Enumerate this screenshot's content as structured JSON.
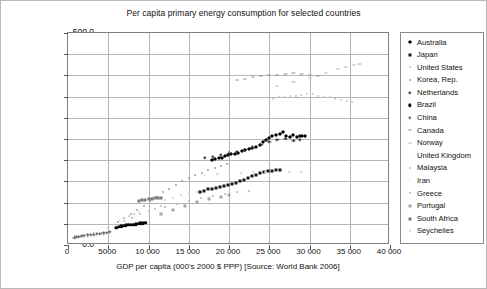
{
  "chart_data": {
    "type": "scatter",
    "title": "Per capita primary energy consumption for selected countries",
    "xlabel": "GDP per capita (000's 2000 $ PPP) [Source: World Bank 2006]",
    "ylabel_line1": "Primary energy consumption/(GJ·capita⁻¹) [Source: EIA",
    "ylabel_line2": "International Energy Annual 2004]",
    "xlim": [
      0,
      40000
    ],
    "ylim": [
      0,
      500
    ],
    "xticks": [
      "0",
      "5000",
      "10 000",
      "15 000",
      "20 000",
      "25 000",
      "30 000",
      "35 000",
      "40 000"
    ],
    "xtick_values": [
      0,
      5000,
      10000,
      15000,
      20000,
      25000,
      30000,
      35000,
      40000
    ],
    "yticks": [
      "0.0",
      "50.0",
      "100.0",
      "150.0",
      "200.0",
      "250.0",
      "300.0",
      "350.0",
      "400.0",
      "450.0",
      "500.0"
    ],
    "ytick_values": [
      0,
      50,
      100,
      150,
      200,
      250,
      300,
      350,
      400,
      450,
      500
    ],
    "grid": true,
    "legend_position": "right-outside",
    "series": [
      {
        "name": "Australia",
        "marker": "diamond",
        "color": "#000000",
        "points": [
          [
            17900,
            200
          ],
          [
            18300,
            203
          ],
          [
            18700,
            206
          ],
          [
            19100,
            205
          ],
          [
            19500,
            209
          ],
          [
            19900,
            212
          ],
          [
            20300,
            215
          ],
          [
            20700,
            214
          ],
          [
            21100,
            218
          ],
          [
            21600,
            221
          ],
          [
            22000,
            223
          ],
          [
            22500,
            226
          ],
          [
            22900,
            229
          ],
          [
            23300,
            231
          ],
          [
            23800,
            236
          ],
          [
            24200,
            243
          ],
          [
            24600,
            248
          ],
          [
            25000,
            252
          ],
          [
            25400,
            256
          ],
          [
            25900,
            259
          ],
          [
            26300,
            262
          ],
          [
            26700,
            266
          ],
          [
            27100,
            258
          ],
          [
            27600,
            255
          ],
          [
            28000,
            259
          ],
          [
            28400,
            254
          ],
          [
            28800,
            257
          ],
          [
            29100,
            256
          ],
          [
            29400,
            258
          ]
        ]
      },
      {
        "name": "Japan",
        "marker": "square",
        "color": "#181818",
        "points": [
          [
            16400,
            125
          ],
          [
            16900,
            128
          ],
          [
            17400,
            131
          ],
          [
            17900,
            133
          ],
          [
            18400,
            134
          ],
          [
            18900,
            137
          ],
          [
            19400,
            139
          ],
          [
            19900,
            141
          ],
          [
            20400,
            143
          ],
          [
            20900,
            146
          ],
          [
            21400,
            150
          ],
          [
            21900,
            154
          ],
          [
            22400,
            158
          ],
          [
            22900,
            162
          ],
          [
            23400,
            166
          ],
          [
            23900,
            170
          ],
          [
            24400,
            172
          ],
          [
            24900,
            174
          ],
          [
            25400,
            175
          ],
          [
            25900,
            176
          ],
          [
            26300,
            177
          ]
        ]
      },
      {
        "name": "United States",
        "marker": "dot",
        "color": "#c6c6c6",
        "points": [
          [
            25500,
            345
          ],
          [
            26200,
            348
          ],
          [
            26900,
            350
          ],
          [
            27600,
            352
          ],
          [
            28300,
            351
          ],
          [
            29000,
            353
          ],
          [
            29700,
            355
          ],
          [
            30400,
            356
          ],
          [
            31100,
            352
          ],
          [
            31800,
            350
          ],
          [
            32500,
            348
          ],
          [
            33200,
            345
          ],
          [
            33900,
            343
          ],
          [
            34600,
            340
          ],
          [
            35300,
            338
          ]
        ]
      },
      {
        "name": "Korea, Rep.",
        "marker": "dot",
        "color": "#9e9e9e",
        "points": [
          [
            6200,
            55
          ],
          [
            7000,
            63
          ],
          [
            7800,
            72
          ],
          [
            8600,
            82
          ],
          [
            9400,
            92
          ],
          [
            10200,
            103
          ],
          [
            11000,
            114
          ],
          [
            11800,
            124
          ],
          [
            12600,
            133
          ],
          [
            13400,
            142
          ],
          [
            14200,
            150
          ],
          [
            15000,
            157
          ],
          [
            15800,
            164
          ],
          [
            16600,
            170
          ],
          [
            17400,
            176
          ],
          [
            18200,
            182
          ],
          [
            19000,
            187
          ],
          [
            19800,
            191
          ]
        ]
      },
      {
        "name": "Netherlands",
        "marker": "cross",
        "color": "#2a2a2a",
        "points": [
          [
            17000,
            205
          ],
          [
            18000,
            208
          ],
          [
            19000,
            212
          ],
          [
            20000,
            216
          ],
          [
            21000,
            220
          ],
          [
            22000,
            224
          ],
          [
            23000,
            230
          ],
          [
            24000,
            237
          ],
          [
            25000,
            243
          ],
          [
            26000,
            248
          ],
          [
            27000,
            250
          ],
          [
            28000,
            246
          ],
          [
            28800,
            248
          ]
        ]
      },
      {
        "name": "Brazil",
        "marker": "circle",
        "color": "#0a0a0a",
        "points": [
          [
            6000,
            41
          ],
          [
            6300,
            43
          ],
          [
            6600,
            44
          ],
          [
            6900,
            45
          ],
          [
            7200,
            46
          ],
          [
            7500,
            47
          ],
          [
            7800,
            48
          ],
          [
            8100,
            48
          ],
          [
            8400,
            49
          ],
          [
            8700,
            50
          ],
          [
            9000,
            51
          ],
          [
            9300,
            51
          ],
          [
            9600,
            52
          ]
        ]
      },
      {
        "name": "China",
        "marker": "plus",
        "color": "#5a5a5a",
        "points": [
          [
            800,
            18
          ],
          [
            1100,
            19
          ],
          [
            1400,
            20
          ],
          [
            1700,
            21
          ],
          [
            2000,
            22
          ],
          [
            2400,
            23
          ],
          [
            2800,
            24
          ],
          [
            3200,
            25
          ],
          [
            3600,
            26
          ],
          [
            4000,
            27
          ],
          [
            4400,
            28
          ],
          [
            4800,
            29
          ],
          [
            5200,
            31
          ]
        ]
      },
      {
        "name": "Canada",
        "marker": "dash",
        "color": "#8c8c8c",
        "points": [
          [
            21000,
            390
          ],
          [
            22000,
            392
          ],
          [
            23000,
            396
          ],
          [
            24000,
            398
          ],
          [
            25000,
            400
          ],
          [
            26000,
            402
          ],
          [
            27000,
            404
          ],
          [
            28000,
            405
          ],
          [
            29000,
            403
          ],
          [
            30000,
            401
          ],
          [
            31000,
            399
          ]
        ]
      },
      {
        "name": "Norway",
        "marker": "dash",
        "color": "#b0b0b0",
        "points": [
          [
            26000,
            375
          ],
          [
            28000,
            385
          ],
          [
            30000,
            395
          ],
          [
            32000,
            405
          ],
          [
            33500,
            415
          ],
          [
            34500,
            420
          ],
          [
            35500,
            424
          ],
          [
            36200,
            426
          ]
        ]
      },
      {
        "name": "United Kingdom",
        "marker": "none",
        "color": "#d2d2d2",
        "points": [
          [
            17000,
            165
          ],
          [
            18500,
            167
          ],
          [
            20000,
            169
          ],
          [
            21500,
            170
          ],
          [
            23000,
            171
          ],
          [
            24500,
            172
          ],
          [
            26000,
            173
          ],
          [
            27500,
            172
          ],
          [
            29000,
            171
          ]
        ]
      },
      {
        "name": "Malaysia",
        "marker": "dot",
        "color": "#bdbdbd",
        "points": [
          [
            5000,
            40
          ],
          [
            6000,
            48
          ],
          [
            7000,
            56
          ],
          [
            8000,
            64
          ],
          [
            9000,
            72
          ],
          [
            10000,
            80
          ],
          [
            10800,
            86
          ],
          [
            11500,
            92
          ]
        ]
      },
      {
        "name": "Iran",
        "marker": "none",
        "color": "#cccccc",
        "points": [
          [
            5200,
            48
          ],
          [
            5800,
            53
          ],
          [
            6400,
            58
          ],
          [
            7000,
            63
          ],
          [
            7600,
            68
          ],
          [
            8200,
            73
          ],
          [
            8800,
            78
          ]
        ]
      },
      {
        "name": "Greece",
        "marker": "dot",
        "color": "#b5b5b5",
        "points": [
          [
            12000,
            90
          ],
          [
            13500,
            97
          ],
          [
            15000,
            104
          ],
          [
            16500,
            110
          ],
          [
            18000,
            116
          ],
          [
            19500,
            121
          ],
          [
            21000,
            125
          ],
          [
            22500,
            128
          ]
        ]
      },
      {
        "name": "Portugal",
        "marker": "square",
        "color": "#a5a5a5",
        "points": [
          [
            11500,
            72
          ],
          [
            13000,
            82
          ],
          [
            14500,
            92
          ],
          [
            16000,
            101
          ],
          [
            17500,
            108
          ],
          [
            19000,
            114
          ],
          [
            20000,
            118
          ]
        ]
      },
      {
        "name": "South Africa",
        "marker": "square",
        "color": "#7a7a7a",
        "points": [
          [
            8800,
            104
          ],
          [
            9200,
            106
          ],
          [
            9600,
            107
          ],
          [
            10000,
            108
          ],
          [
            10400,
            109
          ],
          [
            10800,
            110
          ],
          [
            11200,
            111
          ],
          [
            11600,
            112
          ]
        ]
      },
      {
        "name": "Seychelles",
        "marker": "dot",
        "color": "#cfcfcf",
        "points": [
          [
            12000,
            105
          ],
          [
            13000,
            112
          ],
          [
            14000,
            118
          ],
          [
            15000,
            122
          ],
          [
            16000,
            126
          ]
        ]
      }
    ]
  }
}
